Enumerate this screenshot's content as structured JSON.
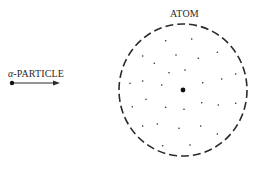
{
  "diagram": {
    "atom": {
      "label": "ATOM",
      "center": [
        183,
        90
      ],
      "radius_x": 64,
      "radius_y": 66,
      "outline": "dashed",
      "nucleus": {
        "center": [
          183,
          90
        ],
        "radius": 2.4
      },
      "electron_dots": [
        [
          165.7,
          40.7
        ],
        [
          191.7,
          39
        ],
        [
          142.7,
          56
        ],
        [
          176,
          55
        ],
        [
          154.3,
          63.3
        ],
        [
          185,
          70
        ],
        [
          169,
          72.7
        ],
        [
          130,
          83.3
        ],
        [
          142.7,
          81
        ],
        [
          161.7,
          85
        ],
        [
          146,
          99.3
        ],
        [
          132.3,
          106.7
        ],
        [
          165.7,
          107.3
        ],
        [
          184,
          109.3
        ],
        [
          142.7,
          126
        ],
        [
          157.3,
          124
        ],
        [
          179,
          128.3
        ],
        [
          162.7,
          145.7
        ],
        [
          190,
          145
        ],
        [
          217.3,
          52.3
        ],
        [
          198.3,
          58.3
        ],
        [
          221.7,
          79
        ],
        [
          235.7,
          74
        ],
        [
          202.7,
          82.7
        ],
        [
          201.7,
          102.7
        ],
        [
          218.3,
          105
        ],
        [
          235.7,
          103.3
        ],
        [
          200.7,
          126
        ],
        [
          217.3,
          134
        ]
      ]
    },
    "alpha_particle": {
      "label_greek": "α",
      "label_text": "-PARTICLE",
      "start": [
        12,
        83
      ],
      "end": [
        60,
        83
      ]
    },
    "colors": {
      "ink": "#2a2a2a",
      "background": "#ffffff"
    }
  }
}
